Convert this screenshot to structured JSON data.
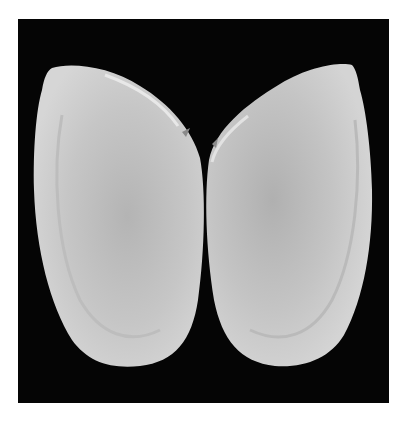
{
  "image": {
    "subject": "Open bivalve shell, interior view of both valves",
    "background_color": "#050505",
    "frame_color": "#ffffff",
    "shell_color": "#cfcfcf",
    "shell_shadow_color": "#a9a9a9"
  }
}
